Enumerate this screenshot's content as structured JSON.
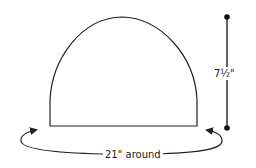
{
  "diagram": {
    "shape": "dome",
    "colors": {
      "stroke": "#222222",
      "background": "#ffffff"
    },
    "labels": {
      "height": "7½\"",
      "circumference": "21\" around"
    },
    "measurements": {
      "height_inches": 7.5,
      "circumference_inches": 21
    }
  }
}
